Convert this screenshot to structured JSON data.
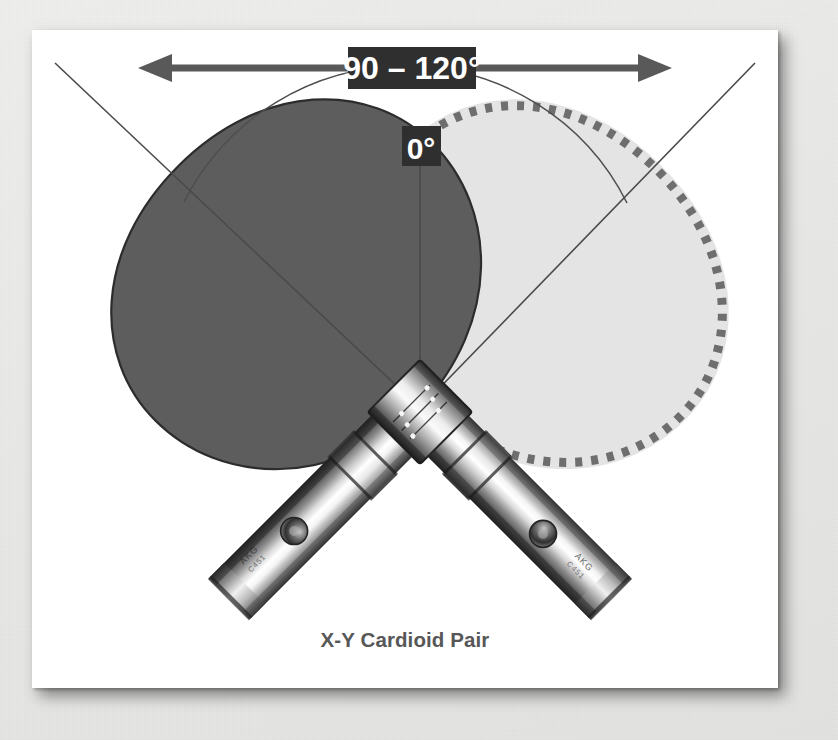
{
  "figure": {
    "caption": "X-Y Cardioid Pair",
    "angle_label": "90 – 120°",
    "axis_label": "0°",
    "arrow_name": "double-headed-angle-arrow"
  },
  "colors": {
    "panel_background": "#ffffff",
    "outer_background": "#ebebea",
    "label_box": "#2f2f2f",
    "label_text": "#ffffff",
    "arrow": "#595959",
    "guide_line": "#4a4a4a",
    "cardioid_dark": "#5c5c5c",
    "cardioid_light": "#e2e2e2",
    "dashed_outline": "#707070",
    "caption_text": "#575757",
    "mic_body_light": "#f2f2f2",
    "mic_body_mid": "#9a9a9a",
    "mic_body_dark": "#3d3d3d"
  },
  "diagram_elements": {
    "dark_cardioid_name": "left-channel-cardioid-polar-pattern",
    "light_cardioid_name": "right-channel-cardioid-polar-pattern",
    "dashed_circle_name": "dashed-pattern-outline",
    "left_mic_name": "left-microphone",
    "right_mic_name": "right-microphone",
    "mic_clamp_name": "stereo-bar-clamp",
    "arc_name": "acceptance-angle-arc",
    "center_axis_name": "center-axis-line"
  },
  "mic_markings": {
    "left": "AKG",
    "right": "AKG"
  }
}
